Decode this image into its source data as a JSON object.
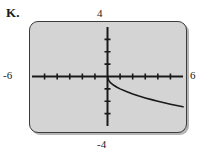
{
  "figure": {
    "problem_label": "K.",
    "type": "graphing-calculator-screen"
  },
  "axis_labels": {
    "y_max": "4",
    "y_min": "-4",
    "x_min": "-6",
    "x_max": "6"
  },
  "colors": {
    "screen_fill": "#d4d4d4",
    "screen_border": "#3b3b3b",
    "axis": "#1a1a1a",
    "curve": "#1a1a1a",
    "text": "#1a1a1a",
    "page_background": "#ffffff"
  },
  "chart_data": {
    "type": "line",
    "title": "K.",
    "xlabel": "",
    "ylabel": "",
    "xlim": [
      -6,
      6
    ],
    "ylim": [
      -4,
      4
    ],
    "grid": false,
    "legend": "none",
    "x_tick_labels": [
      "-6",
      "6"
    ],
    "y_tick_labels": [
      "4",
      "-4"
    ],
    "x_tick_step": 1,
    "y_tick_step": 1,
    "x_ticks": [
      -5,
      -4,
      -3,
      -2,
      -1,
      1,
      2,
      3,
      4,
      5
    ],
    "y_ticks": [
      -3,
      -2,
      -1,
      1,
      2,
      3
    ],
    "series": [
      {
        "name": "decreasing radical curve",
        "description": "starts at the origin and decreases to the right, steep near x=0 then flattening",
        "x": [
          0,
          0.1,
          0.2,
          0.3,
          0.5,
          0.75,
          1,
          1.5,
          2,
          2.5,
          3,
          3.5,
          4,
          4.5,
          5,
          5.5,
          6
        ],
        "y": [
          0,
          -0.32,
          -0.45,
          -0.55,
          -0.71,
          -0.87,
          -1.0,
          -1.22,
          -1.41,
          -1.58,
          -1.73,
          -1.87,
          -2.0,
          -2.12,
          -2.24,
          -2.35,
          -2.45
        ]
      }
    ]
  }
}
